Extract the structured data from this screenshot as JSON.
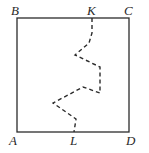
{
  "diagram": {
    "type": "square-with-broken-path",
    "colors": {
      "stroke": "#2b2b2b",
      "background": "#ffffff"
    },
    "square": {
      "x": 17,
      "y": 18,
      "width": 112,
      "height": 114
    },
    "labels": {
      "A": "A",
      "B": "B",
      "C": "C",
      "D": "D",
      "K": "K",
      "L": "L"
    },
    "label_positions": {
      "B": [
        11,
        15
      ],
      "K": [
        87,
        15
      ],
      "C": [
        124,
        15
      ],
      "A": [
        9,
        145
      ],
      "L": [
        70,
        145
      ],
      "D": [
        126,
        145
      ]
    },
    "dashed_path": [
      [
        92,
        18
      ],
      [
        92,
        33
      ],
      [
        89,
        43
      ],
      [
        75,
        55
      ],
      [
        100,
        67
      ],
      [
        100,
        93
      ],
      [
        83,
        87
      ],
      [
        53,
        103
      ],
      [
        76,
        119
      ],
      [
        74,
        132
      ]
    ]
  }
}
